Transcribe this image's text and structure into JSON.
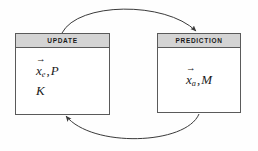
{
  "diagram": {
    "background_color": "#fefefe",
    "stroke_color": "#3a3a3a",
    "header_fill": "#d4d4d4",
    "box_border_color": "#5a5a5a",
    "nodes": [
      {
        "id": "update",
        "header": "UPDATE",
        "lines": [
          {
            "vector_symbol": "x",
            "vector_accent": "→",
            "subscript": "e",
            "separator": ",",
            "second_symbol": "P"
          },
          {
            "vector_symbol": "",
            "vector_accent": "",
            "subscript": "",
            "separator": "",
            "second_symbol": "K"
          }
        ]
      },
      {
        "id": "prediction",
        "header": "PREDICTION",
        "lines": [
          {
            "vector_symbol": "x",
            "vector_accent": "→",
            "subscript": "a",
            "separator": ",",
            "second_symbol": "M"
          }
        ]
      }
    ],
    "arrows": [
      {
        "id": "update-to-prediction",
        "label": "",
        "direction": "top-arc-left-to-right",
        "from": "update",
        "to": "prediction"
      },
      {
        "id": "prediction-to-update",
        "label": "",
        "direction": "bottom-arc-right-to-left",
        "from": "prediction",
        "to": "update"
      }
    ]
  }
}
